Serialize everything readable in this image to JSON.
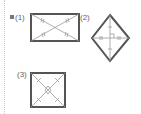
{
  "problems": [
    {
      "label": "(1)",
      "shape": "rectangle",
      "marked": true
    },
    {
      "label": "(2)",
      "shape": "rhombus"
    },
    {
      "label": "(3)",
      "shape": "square"
    }
  ],
  "colors": {
    "stroke": "#555555",
    "label": "#666666",
    "bullet": "#777777"
  }
}
